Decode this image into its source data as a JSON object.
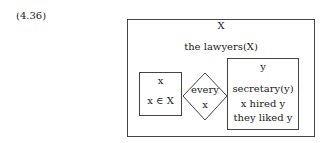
{
  "example_number": "(4.36)",
  "drs": {
    "outer": {
      "universe": "X",
      "conditions": [
        "the lawyers(X)"
      ]
    },
    "duplex": {
      "left_box": {
        "universe": "x",
        "conditions": [
          "x ∈ X"
        ]
      },
      "quantifier": {
        "word": "every",
        "variable": "x"
      },
      "right_box": {
        "universe": "y",
        "conditions": [
          "secretary(y)",
          "x hired y",
          "they liked y"
        ]
      }
    }
  }
}
